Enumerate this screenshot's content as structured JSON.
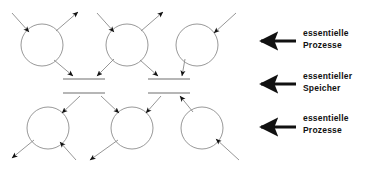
{
  "diagram": {
    "type": "data-flow-diagram",
    "background_color": "#ffffff",
    "stroke_color": "#111111",
    "circle_stroke_color": "#7d7d7d",
    "flow_stroke_color": "#8a8a8a",
    "store_stroke_color": "#6e6e6e",
    "processes_top": [
      {
        "id": "p1",
        "cx": 42,
        "cy": 45,
        "r": 21
      },
      {
        "id": "p2",
        "cx": 127,
        "cy": 45,
        "r": 21
      },
      {
        "id": "p3",
        "cx": 197,
        "cy": 45,
        "r": 21
      }
    ],
    "processes_bottom": [
      {
        "id": "p4",
        "cx": 48,
        "cy": 128,
        "r": 21
      },
      {
        "id": "p5",
        "cx": 132,
        "cy": 128,
        "r": 21
      },
      {
        "id": "p6",
        "cx": 202,
        "cy": 128,
        "r": 21
      }
    ],
    "stores": [
      {
        "id": "s1-upper",
        "x1": 63,
        "x2": 105,
        "y": 79
      },
      {
        "id": "s2-upper",
        "x1": 148,
        "x2": 190,
        "y": 79
      },
      {
        "id": "s1-lower",
        "x1": 63,
        "x2": 105,
        "y": 93
      },
      {
        "id": "s2-lower",
        "x1": 148,
        "x2": 190,
        "y": 93
      }
    ]
  },
  "annotations": [
    {
      "id": "processes-top",
      "arrow": "left-arrow-icon",
      "line1": "essentielle",
      "line2": "Prozesse"
    },
    {
      "id": "store-middle",
      "arrow": "left-arrow-icon",
      "line1": "essentieller",
      "line2": "Speicher"
    },
    {
      "id": "processes-bottom",
      "arrow": "left-arrow-icon",
      "line1": "essentielle",
      "line2": "Prozesse"
    }
  ]
}
